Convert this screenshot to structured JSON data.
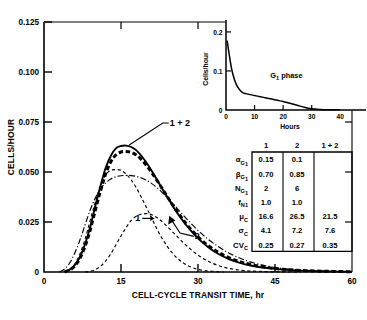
{
  "chart_data": [
    {
      "id": "main",
      "type": "line",
      "title": "",
      "xlabel": "CELL-CYCLE TRANSIT TIME, hr",
      "ylabel": "CELLS/HOUR",
      "xlim": [
        0,
        60
      ],
      "ylim": [
        0,
        0.125
      ],
      "xticks": [
        0,
        15,
        30,
        45,
        60
      ],
      "xtick_labels": [
        "0",
        "15",
        "30",
        "45",
        "60"
      ],
      "yticks": [
        0,
        0.025,
        0.05,
        0.075,
        0.1,
        0.125
      ],
      "ytick_labels": [
        "0",
        "0.025",
        "0.050",
        "0.075",
        "0.100",
        "0.125"
      ],
      "grid": false,
      "legend": "none",
      "annotations": [
        {
          "text": "1 + 2",
          "x": 24.5,
          "y": 0.0745,
          "name": "curve-label-1plus2"
        },
        {
          "text": "1",
          "x": 20.5,
          "y": 0.0268,
          "name": "curve-label-1"
        },
        {
          "text": "2",
          "x": 29.0,
          "y": 0.0178,
          "name": "curve-label-2"
        }
      ],
      "series": [
        {
          "name": "1 + 2 observed",
          "style": "solid",
          "x": [
            4,
            5,
            6,
            7,
            8,
            9,
            10,
            11,
            12,
            13,
            14,
            15,
            16,
            17,
            18,
            19,
            20,
            21,
            22,
            23,
            24,
            25,
            26,
            27,
            28,
            30,
            32,
            34,
            36,
            38,
            40,
            43,
            46,
            50,
            54,
            58,
            60
          ],
          "y": [
            0.0,
            0.0012,
            0.0035,
            0.0075,
            0.014,
            0.0225,
            0.033,
            0.043,
            0.052,
            0.058,
            0.0618,
            0.063,
            0.0632,
            0.0625,
            0.0608,
            0.058,
            0.0545,
            0.0505,
            0.0462,
            0.0418,
            0.0375,
            0.0333,
            0.0294,
            0.0258,
            0.0225,
            0.0168,
            0.0124,
            0.009,
            0.0065,
            0.0047,
            0.0034,
            0.0021,
            0.0013,
            0.0007,
            0.0004,
            0.0002,
            0.0001
          ]
        },
        {
          "name": "1 + 2 fitted",
          "style": "heavy-dashed",
          "x": [
            4,
            5,
            6,
            7,
            8,
            9,
            10,
            11,
            12,
            13,
            14,
            15,
            16,
            17,
            18,
            19,
            20,
            21,
            22,
            23,
            24,
            25,
            26,
            27,
            28,
            30,
            32,
            34,
            36,
            38,
            40,
            43,
            46,
            50,
            54,
            58,
            60
          ],
          "y": [
            0.0,
            0.001,
            0.003,
            0.0068,
            0.0128,
            0.021,
            0.031,
            0.0405,
            0.049,
            0.055,
            0.0585,
            0.06,
            0.0602,
            0.0598,
            0.0585,
            0.0562,
            0.0532,
            0.0497,
            0.0458,
            0.0418,
            0.0378,
            0.0338,
            0.03,
            0.0265,
            0.0232,
            0.0176,
            0.0132,
            0.0098,
            0.0072,
            0.0053,
            0.0039,
            0.0024,
            0.0015,
            0.0008,
            0.0004,
            0.0002,
            0.0001
          ]
        },
        {
          "name": "sum of components",
          "style": "dash-dot",
          "x": [
            3,
            4,
            5,
            6,
            7,
            8,
            9,
            10,
            11,
            12,
            13,
            14,
            15,
            16,
            17,
            18,
            19,
            20,
            21,
            22,
            23,
            24,
            25,
            26,
            27,
            28,
            30,
            32,
            34,
            36,
            38,
            40,
            43,
            46,
            50,
            54,
            58,
            60
          ],
          "y": [
            0.0,
            0.0015,
            0.0045,
            0.0095,
            0.016,
            0.0235,
            0.031,
            0.037,
            0.0415,
            0.0445,
            0.0465,
            0.0476,
            0.0481,
            0.0483,
            0.0482,
            0.0478,
            0.047,
            0.0458,
            0.0442,
            0.0422,
            0.0398,
            0.0372,
            0.0345,
            0.0316,
            0.0288,
            0.026,
            0.0208,
            0.0163,
            0.0126,
            0.0095,
            0.0071,
            0.0052,
            0.0032,
            0.0019,
            0.001,
            0.0005,
            0.0002,
            0.0001
          ]
        },
        {
          "name": "component 1",
          "style": "dashed",
          "x": [
            4,
            5,
            6,
            7,
            8,
            9,
            10,
            11,
            12,
            13,
            14,
            15,
            16,
            17,
            18,
            19,
            20,
            21,
            22,
            23,
            24,
            25,
            26,
            27,
            28,
            29,
            30,
            31,
            32,
            33,
            34,
            35
          ],
          "y": [
            0.0,
            0.0012,
            0.004,
            0.009,
            0.0165,
            0.0258,
            0.035,
            0.043,
            0.0485,
            0.0508,
            0.0512,
            0.0508,
            0.049,
            0.046,
            0.042,
            0.0372,
            0.032,
            0.0268,
            0.0215,
            0.0168,
            0.0128,
            0.0095,
            0.0068,
            0.0048,
            0.0032,
            0.0021,
            0.0013,
            0.0008,
            0.0005,
            0.0003,
            0.0001,
            0.0
          ]
        },
        {
          "name": "component 2",
          "style": "dashed",
          "x": [
            8,
            9,
            10,
            11,
            12,
            13,
            14,
            15,
            16,
            17,
            18,
            19,
            20,
            21,
            22,
            23,
            24,
            25,
            26,
            27,
            28,
            29,
            30,
            31,
            32,
            33,
            34,
            35,
            36,
            37,
            38,
            40,
            42,
            44,
            46,
            48,
            50
          ],
          "y": [
            0.0,
            0.0004,
            0.0012,
            0.0028,
            0.0055,
            0.009,
            0.0135,
            0.018,
            0.0222,
            0.0258,
            0.028,
            0.029,
            0.0292,
            0.0286,
            0.0272,
            0.0252,
            0.0228,
            0.0202,
            0.0176,
            0.015,
            0.0126,
            0.0104,
            0.0085,
            0.0068,
            0.0054,
            0.0042,
            0.0032,
            0.0024,
            0.0018,
            0.0013,
            0.001,
            0.0005,
            0.0003,
            0.0001,
            0.0001,
            0.0,
            0.0
          ]
        }
      ]
    },
    {
      "id": "inset",
      "type": "line",
      "title": "",
      "xlabel": "Hours",
      "ylabel": "Cells/hour",
      "xlim": [
        0,
        42
      ],
      "ylim": [
        0,
        0.21
      ],
      "xticks": [
        0,
        10,
        20,
        30,
        40
      ],
      "xtick_labels": [
        "0",
        "10",
        "20",
        "30",
        "40"
      ],
      "yticks": [
        0,
        0.1,
        0.2
      ],
      "ytick_labels": [
        "0",
        "0.1",
        "0.2"
      ],
      "grid": false,
      "legend": "none",
      "annotations": [
        {
          "text_main": "G",
          "text_sub": "1",
          "text_tail": " phase",
          "x": 15.5,
          "y": 0.083,
          "name": "g1-phase-annotation"
        }
      ],
      "series": [
        {
          "name": "G1 phase transit distribution",
          "style": "solid",
          "x": [
            0.4,
            1,
            2,
            3,
            4,
            5,
            6,
            7,
            8,
            10,
            12,
            14,
            16,
            18,
            20,
            22,
            24,
            26,
            28,
            30,
            33,
            36,
            40
          ],
          "y": [
            0.178,
            0.148,
            0.104,
            0.077,
            0.06,
            0.05,
            0.044,
            0.042,
            0.04,
            0.037,
            0.034,
            0.031,
            0.028,
            0.025,
            0.022,
            0.018,
            0.014,
            0.01,
            0.006,
            0.003,
            0.0015,
            0.0008,
            0.0004
          ]
        }
      ]
    }
  ],
  "table": {
    "name": "parameter-table",
    "headers": [
      "",
      "1",
      "2",
      "1 + 2"
    ],
    "rows": [
      {
        "label_main": "α",
        "label_sub": "G",
        "label_sub2": "1",
        "values": [
          "0.15",
          "0.1",
          ""
        ]
      },
      {
        "label_main": "β",
        "label_sub": "G",
        "label_sub2": "1",
        "values": [
          "0.70",
          "0.85",
          ""
        ]
      },
      {
        "label_main": "N",
        "label_sub": "G",
        "label_sub2": "1",
        "values": [
          "2",
          "6",
          ""
        ]
      },
      {
        "label_main": "f",
        "label_sub": "N1",
        "label_sub2": "",
        "values": [
          "1.0",
          "1.0",
          ""
        ]
      },
      {
        "label_main": "μ",
        "label_sub": "C",
        "label_sub2": "",
        "values": [
          "16.6",
          "26.5",
          "21.5"
        ]
      },
      {
        "label_main": "σ",
        "label_sub": "C",
        "label_sub2": "",
        "values": [
          "4.1",
          "7.2",
          "7.6"
        ]
      },
      {
        "label_main": "CV",
        "label_sub": "C",
        "label_sub2": "",
        "values": [
          "0.25",
          "0.27",
          "0.35"
        ]
      }
    ]
  },
  "colors": {
    "ink": "#000000",
    "background": "#ffffff"
  }
}
